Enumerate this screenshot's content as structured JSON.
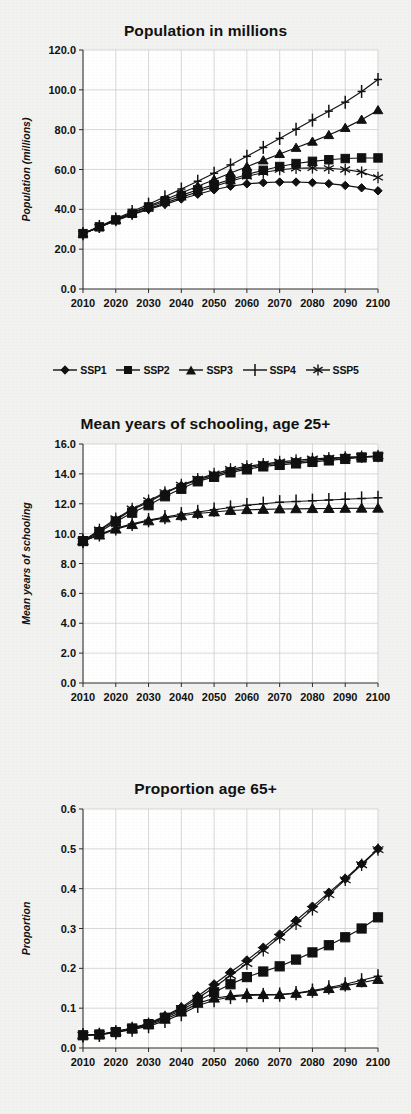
{
  "figure": {
    "background_color": "#f2f2f0",
    "ink_color": "#111111",
    "grid_color": "#c9c9c9"
  },
  "legend": {
    "position": "below-first-chart",
    "items": [
      {
        "label": "SSP1",
        "marker": "diamond-marker"
      },
      {
        "label": "SSP2",
        "marker": "square-marker"
      },
      {
        "label": "SSP3",
        "marker": "triangle-marker"
      },
      {
        "label": "SSP4",
        "marker": "plus-marker"
      },
      {
        "label": "SSP5",
        "marker": "asterisk-marker"
      }
    ]
  },
  "chart_data": [
    {
      "type": "line",
      "title": "Population in millions",
      "xlabel": "",
      "ylabel": "Population (millions)",
      "x": [
        2010,
        2015,
        2020,
        2025,
        2030,
        2035,
        2040,
        2045,
        2050,
        2055,
        2060,
        2065,
        2070,
        2075,
        2080,
        2085,
        2090,
        2095,
        2100
      ],
      "xlim": [
        2010,
        2100
      ],
      "ylim": [
        0.0,
        120.0
      ],
      "xticks": [
        2010,
        2020,
        2030,
        2040,
        2050,
        2060,
        2070,
        2080,
        2090,
        2100
      ],
      "xticklabels": [
        "2010",
        "2020",
        "2030",
        "2040",
        "2050",
        "2060",
        "2070",
        "2080",
        "2090",
        "2100"
      ],
      "yticks": [
        0.0,
        20.0,
        40.0,
        60.0,
        80.0,
        100.0,
        120.0
      ],
      "yticklabels": [
        "0.0",
        "20.0",
        "40.0",
        "60.0",
        "80.0",
        "100.0",
        "120.0"
      ],
      "grid": true,
      "legend_position": "bottom",
      "series": [
        {
          "name": "SSP1",
          "marker": "diamond-marker",
          "values": [
            27.8,
            31.0,
            34.3,
            37.3,
            40.0,
            42.5,
            45.2,
            47.6,
            49.8,
            51.6,
            52.8,
            53.4,
            53.7,
            53.7,
            53.4,
            52.9,
            52.0,
            50.8,
            49.3
          ]
        },
        {
          "name": "SSP2",
          "marker": "square-marker",
          "values": [
            27.8,
            31.2,
            34.7,
            38.0,
            41.2,
            44.1,
            47.0,
            49.8,
            52.4,
            55.0,
            57.5,
            59.6,
            61.5,
            63.0,
            64.1,
            64.9,
            65.5,
            65.8,
            65.8
          ]
        },
        {
          "name": "SSP3",
          "marker": "triangle-marker",
          "values": [
            27.8,
            31.2,
            34.8,
            38.3,
            41.6,
            44.9,
            48.2,
            51.6,
            54.9,
            58.2,
            61.4,
            64.6,
            67.8,
            70.9,
            74.0,
            77.3,
            80.9,
            85.0,
            89.8
          ]
        },
        {
          "name": "SSP4",
          "marker": "plus-marker",
          "values": [
            27.8,
            31.4,
            35.2,
            38.9,
            42.6,
            46.3,
            50.2,
            54.1,
            58.1,
            62.3,
            66.6,
            71.1,
            75.6,
            80.2,
            84.8,
            89.3,
            93.8,
            99.2,
            105.2
          ]
        },
        {
          "name": "SSP5",
          "marker": "asterisk-marker",
          "values": [
            27.8,
            31.0,
            34.4,
            37.5,
            40.4,
            43.1,
            46.0,
            48.8,
            51.5,
            54.1,
            56.5,
            58.5,
            59.9,
            60.6,
            60.8,
            60.6,
            60.0,
            58.7,
            56.0
          ]
        }
      ]
    },
    {
      "type": "line",
      "title": "Mean years of schooling, age 25+",
      "xlabel": "",
      "ylabel": "Mean years of schooling",
      "x": [
        2010,
        2015,
        2020,
        2025,
        2030,
        2035,
        2040,
        2045,
        2050,
        2055,
        2060,
        2065,
        2070,
        2075,
        2080,
        2085,
        2090,
        2095,
        2100
      ],
      "xlim": [
        2010,
        2100
      ],
      "ylim": [
        0.0,
        16.0
      ],
      "xticks": [
        2010,
        2020,
        2030,
        2040,
        2050,
        2060,
        2070,
        2080,
        2090,
        2100
      ],
      "xticklabels": [
        "2010",
        "2020",
        "2030",
        "2040",
        "2050",
        "2060",
        "2070",
        "2080",
        "2090",
        "2100"
      ],
      "yticks": [
        0.0,
        2.0,
        4.0,
        6.0,
        8.0,
        10.0,
        12.0,
        14.0,
        16.0
      ],
      "yticklabels": [
        "0.0",
        "2.0",
        "4.0",
        "6.0",
        "8.0",
        "10.0",
        "12.0",
        "14.0",
        "16.0"
      ],
      "grid": true,
      "legend_position": "none",
      "series": [
        {
          "name": "SSP1",
          "marker": "diamond-marker",
          "values": [
            9.5,
            10.2,
            10.9,
            11.6,
            12.1,
            12.7,
            13.2,
            13.6,
            13.9,
            14.2,
            14.4,
            14.6,
            14.7,
            14.8,
            14.9,
            15.0,
            15.1,
            15.15,
            15.2
          ]
        },
        {
          "name": "SSP2",
          "marker": "square-marker",
          "values": [
            9.5,
            10.1,
            10.8,
            11.4,
            11.9,
            12.5,
            13.0,
            13.5,
            13.8,
            14.1,
            14.3,
            14.5,
            14.6,
            14.7,
            14.8,
            14.9,
            15.0,
            15.1,
            15.15
          ]
        },
        {
          "name": "SSP3",
          "marker": "triangle-marker",
          "values": [
            9.5,
            9.9,
            10.3,
            10.6,
            10.85,
            11.05,
            11.2,
            11.35,
            11.45,
            11.55,
            11.6,
            11.62,
            11.65,
            11.66,
            11.67,
            11.68,
            11.69,
            11.7,
            11.7
          ]
        },
        {
          "name": "SSP4",
          "marker": "plus-marker",
          "values": [
            9.5,
            9.95,
            10.35,
            10.65,
            10.9,
            11.1,
            11.3,
            11.45,
            11.6,
            11.75,
            11.9,
            12.0,
            12.1,
            12.15,
            12.2,
            12.25,
            12.3,
            12.35,
            12.4
          ]
        },
        {
          "name": "SSP5",
          "marker": "asterisk-marker",
          "values": [
            9.5,
            10.25,
            11.0,
            11.65,
            12.2,
            12.75,
            13.25,
            13.65,
            14.0,
            14.3,
            14.5,
            14.65,
            14.8,
            14.9,
            15.0,
            15.05,
            15.1,
            15.15,
            15.2
          ]
        }
      ]
    },
    {
      "type": "line",
      "title": "Proportion age 65+",
      "xlabel": "",
      "ylabel": "Proportion",
      "x": [
        2010,
        2015,
        2020,
        2025,
        2030,
        2035,
        2040,
        2045,
        2050,
        2055,
        2060,
        2065,
        2070,
        2075,
        2080,
        2085,
        2090,
        2095,
        2100
      ],
      "xlim": [
        2010,
        2100
      ],
      "ylim": [
        0.0,
        0.6
      ],
      "xticks": [
        2010,
        2020,
        2030,
        2040,
        2050,
        2060,
        2070,
        2080,
        2090,
        2100
      ],
      "xticklabels": [
        "2010",
        "2020",
        "2030",
        "2040",
        "2050",
        "2060",
        "2070",
        "2080",
        "2090",
        "2100"
      ],
      "yticks": [
        0.0,
        0.1,
        0.2,
        0.3,
        0.4,
        0.5,
        0.6
      ],
      "yticklabels": [
        "0.0",
        "0.1",
        "0.2",
        "0.3",
        "0.4",
        "0.5",
        "0.6"
      ],
      "grid": true,
      "legend_position": "none",
      "series": [
        {
          "name": "SSP1",
          "marker": "diamond-marker",
          "values": [
            0.032,
            0.034,
            0.041,
            0.05,
            0.062,
            0.08,
            0.102,
            0.13,
            0.16,
            0.19,
            0.22,
            0.252,
            0.285,
            0.32,
            0.355,
            0.39,
            0.425,
            0.462,
            0.5
          ]
        },
        {
          "name": "SSP2",
          "marker": "square-marker",
          "values": [
            0.032,
            0.034,
            0.04,
            0.049,
            0.06,
            0.076,
            0.095,
            0.118,
            0.14,
            0.16,
            0.178,
            0.192,
            0.205,
            0.222,
            0.24,
            0.258,
            0.278,
            0.3,
            0.328
          ]
        },
        {
          "name": "SSP3",
          "marker": "triangle-marker",
          "values": [
            0.032,
            0.034,
            0.04,
            0.048,
            0.058,
            0.072,
            0.09,
            0.112,
            0.125,
            0.131,
            0.134,
            0.134,
            0.134,
            0.137,
            0.142,
            0.149,
            0.156,
            0.164,
            0.172
          ]
        },
        {
          "name": "SSP4",
          "marker": "plus-marker",
          "values": [
            0.032,
            0.033,
            0.039,
            0.046,
            0.055,
            0.068,
            0.085,
            0.106,
            0.12,
            0.128,
            0.132,
            0.133,
            0.134,
            0.138,
            0.144,
            0.152,
            0.16,
            0.17,
            0.18
          ]
        },
        {
          "name": "SSP5",
          "marker": "asterisk-marker",
          "values": [
            0.032,
            0.034,
            0.041,
            0.05,
            0.061,
            0.078,
            0.099,
            0.125,
            0.152,
            0.182,
            0.212,
            0.245,
            0.278,
            0.312,
            0.348,
            0.385,
            0.422,
            0.46,
            0.498
          ]
        }
      ]
    }
  ]
}
